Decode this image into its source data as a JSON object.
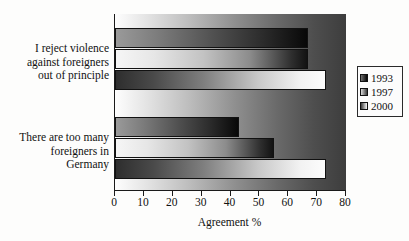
{
  "chart_data": {
    "type": "bar",
    "orientation": "horizontal",
    "title": "",
    "xlabel": "Agreement %",
    "ylabel": "",
    "xlim": [
      0,
      80
    ],
    "xticks": [
      0,
      10,
      20,
      30,
      40,
      50,
      60,
      70,
      80
    ],
    "grid": false,
    "legend_position": "right",
    "categories": [
      "I reject violence against foreigners out of principle",
      "There are too many foreigners in Germany"
    ],
    "category_lines": [
      [
        "I reject violence",
        "against foreigners",
        "out of principle"
      ],
      [
        "There are too many",
        "foreigners in",
        "Germany"
      ]
    ],
    "series": [
      {
        "name": "1993",
        "values": [
          67,
          43
        ]
      },
      {
        "name": "1997",
        "values": [
          67,
          55
        ]
      },
      {
        "name": "2000",
        "values": [
          73,
          73
        ]
      }
    ]
  },
  "legend": {
    "entries": [
      {
        "label": "1993",
        "swatch": "series-1993-swatch"
      },
      {
        "label": "1997",
        "swatch": "series-1997-swatch"
      },
      {
        "label": "2000",
        "swatch": "series-2000-swatch"
      }
    ]
  },
  "axis": {
    "x_title": "Agreement %",
    "x_tick_labels": [
      "0",
      "10",
      "20",
      "30",
      "40",
      "50",
      "60",
      "70",
      "80"
    ]
  },
  "colors": {
    "axis": "#1a1a1a",
    "text": "#111111",
    "plot_background_light": "#fefefe",
    "plot_background_dark": "#3d3d3d",
    "series_1993_dark": "#080808",
    "series_1997_mid": "#8c8c8c",
    "series_2000_light": "#fcfcfc"
  }
}
